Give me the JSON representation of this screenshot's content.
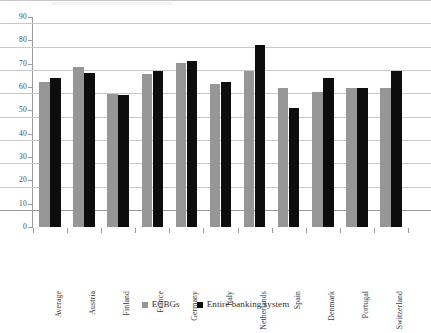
{
  "chart_data": {
    "type": "bar",
    "title": "",
    "subtitle": "",
    "xlabel": "",
    "ylabel": "",
    "ylim": [
      0,
      90
    ],
    "ytick_step": 10,
    "yticks": [
      "90",
      "80",
      "70",
      "60",
      "50",
      "40",
      "30",
      "20",
      "10",
      "0"
    ],
    "grid": true,
    "legend_position": "bottom",
    "categories": [
      "Average",
      "Austria",
      "Finland",
      "France",
      "Germany",
      "Italy",
      "Netherlands",
      "Spain",
      "Denmark",
      "Portugal",
      "Switzerland"
    ],
    "series": [
      {
        "name": "ECBGs",
        "color": "#969696",
        "values": [
          62,
          68.5,
          57,
          65.5,
          70.4,
          61.5,
          67,
          59.5,
          58,
          59.5,
          59.5
        ]
      },
      {
        "name": "Entire banking system",
        "color": "#0d0d0d",
        "values": [
          64,
          66,
          56.7,
          67,
          71.2,
          62,
          78,
          51,
          64,
          59.5,
          67
        ]
      }
    ]
  },
  "legend": {
    "items": [
      {
        "label": "ECBGs",
        "swatch": "gray-square"
      },
      {
        "label": "Entire banking system",
        "swatch": "black-square"
      }
    ]
  },
  "axis": {
    "y_max_label": "90",
    "y_min_label": "0"
  }
}
